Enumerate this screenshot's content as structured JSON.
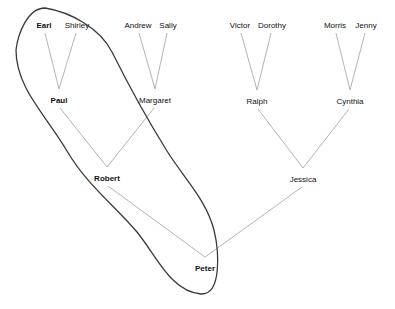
{
  "diagram": {
    "type": "family-tree",
    "background": "#ffffff",
    "colors": {
      "relation_line": "#b4b4b4",
      "ellipse_stroke": "#3a3a3a",
      "text": "#111111"
    },
    "people": [
      {
        "id": "earl",
        "label": "Earl",
        "x": 44,
        "y": 25,
        "bold": true
      },
      {
        "id": "shirley",
        "label": "Shirley",
        "x": 77,
        "y": 25,
        "bold": false
      },
      {
        "id": "andrew",
        "label": "Andrew",
        "x": 138,
        "y": 25,
        "bold": false
      },
      {
        "id": "sally",
        "label": "Sally",
        "x": 168,
        "y": 25,
        "bold": false
      },
      {
        "id": "victor",
        "label": "Victor",
        "x": 240,
        "y": 25,
        "bold": false
      },
      {
        "id": "dorothy",
        "label": "Dorothy",
        "x": 272,
        "y": 25,
        "bold": false
      },
      {
        "id": "morris",
        "label": "Morris",
        "x": 335,
        "y": 25,
        "bold": false
      },
      {
        "id": "jenny",
        "label": "Jenny",
        "x": 366,
        "y": 25,
        "bold": false
      },
      {
        "id": "paul",
        "label": "Paul",
        "x": 59,
        "y": 100,
        "bold": true
      },
      {
        "id": "margaret",
        "label": "Margaret",
        "x": 155,
        "y": 100,
        "bold": false
      },
      {
        "id": "ralph",
        "label": "Ralph",
        "x": 257,
        "y": 101,
        "bold": false
      },
      {
        "id": "cynthia",
        "label": "Cynthia",
        "x": 350,
        "y": 101,
        "bold": false
      },
      {
        "id": "robert",
        "label": "Robert",
        "x": 107,
        "y": 178,
        "bold": true
      },
      {
        "id": "jessica",
        "label": "Jessica",
        "x": 303,
        "y": 179,
        "bold": false
      },
      {
        "id": "peter",
        "label": "Peter",
        "x": 205,
        "y": 268,
        "bold": true
      }
    ],
    "families": [
      {
        "parents": [
          "earl",
          "shirley"
        ],
        "child": "paul"
      },
      {
        "parents": [
          "andrew",
          "sally"
        ],
        "child": "margaret"
      },
      {
        "parents": [
          "victor",
          "dorothy"
        ],
        "child": "ralph"
      },
      {
        "parents": [
          "morris",
          "jenny"
        ],
        "child": "cynthia"
      },
      {
        "parents": [
          "paul",
          "margaret"
        ],
        "child": "robert"
      },
      {
        "parents": [
          "ralph",
          "cynthia"
        ],
        "child": "jessica"
      },
      {
        "parents": [
          "robert",
          "jessica"
        ],
        "child": "peter"
      }
    ],
    "annotation": {
      "shape": "ellipse-loop",
      "encircled": [
        "earl",
        "paul",
        "robert",
        "peter"
      ],
      "path": "M45,8 C70,12 100,28 112,52 C129,86 147,119 167,151 C183,177 206,199 214,230 C219,251 222,295 201,294 C171,292 156,255 137,232 C114,205 87,185 67,151 C46,115 16,88 16,50 C18,33 28,8 45,8 Z"
    }
  }
}
